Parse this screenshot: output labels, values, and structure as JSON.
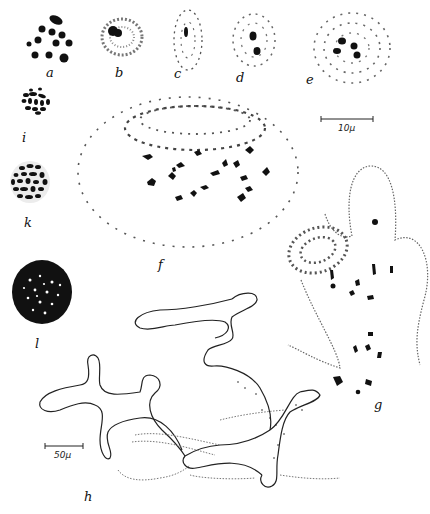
{
  "figure": {
    "background": "#ffffff",
    "ink": "#111111",
    "panels": [
      {
        "id": "a",
        "label": "a",
        "description": "dense black spherical bodies"
      },
      {
        "id": "b",
        "label": "b",
        "description": "nucleus with granular chromatin and dark nucleolus"
      },
      {
        "id": "c",
        "label": "c",
        "description": "elongated nucleus with threads"
      },
      {
        "id": "d",
        "label": "d",
        "description": "nucleus with two dark bodies"
      },
      {
        "id": "e",
        "label": "e",
        "description": "nucleus with four dark bodies"
      },
      {
        "id": "i",
        "label": "i",
        "description": "cluster of rod-shaped bodies"
      },
      {
        "id": "k",
        "label": "k",
        "description": "larger cluster of rod-shaped bodies"
      },
      {
        "id": "f",
        "label": "f",
        "description": "large oval nucleus with dispersed chromatin and central chromosomes"
      },
      {
        "id": "l",
        "label": "l",
        "description": "dense granular sphere"
      },
      {
        "id": "g",
        "label": "g",
        "description": "lobed cell outline with chromosomes"
      },
      {
        "id": "h",
        "label": "h",
        "description": "branching plasmodium network"
      }
    ],
    "scale_bars": [
      {
        "id": "scale-10",
        "label": "10μ"
      },
      {
        "id": "scale-50",
        "label": "50μ"
      }
    ]
  }
}
